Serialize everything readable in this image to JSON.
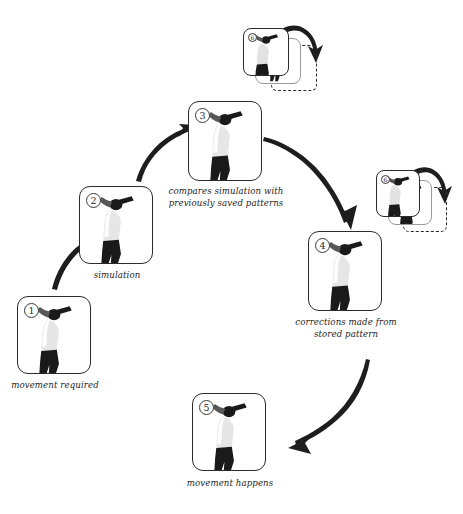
{
  "diagram": {
    "style": "hand-drawn flow diagram, black ink on white",
    "background_color": "#ffffff",
    "ink_color": "#1d1d1d"
  },
  "steps": [
    {
      "id": "step-1",
      "badge": "1",
      "caption": "movement required",
      "figure": "golfer-silhouette"
    },
    {
      "id": "step-2",
      "badge": "2",
      "caption": "simulation",
      "figure": "golfer-silhouette"
    },
    {
      "id": "step-3",
      "badge": "3",
      "caption": "compares simulation with\npreviously saved patterns",
      "figure": "golfer-silhouette"
    },
    {
      "id": "step-4",
      "badge": "4",
      "caption": "corrections made from\nstored pattern",
      "figure": "golfer-silhouette"
    },
    {
      "id": "step-5",
      "badge": "5",
      "caption": "movement happens",
      "figure": "golfer-silhouette"
    }
  ],
  "memory_stacks": [
    {
      "id": "memory-stack-top",
      "badge": "6",
      "caption": ""
    },
    {
      "id": "memory-stack-right",
      "badge": "6",
      "caption": ""
    }
  ],
  "arrows": [
    {
      "id": "arrow-1-to-2",
      "from": "step-1",
      "to": "step-2",
      "shape": "curve-up-right"
    },
    {
      "id": "arrow-2-to-3",
      "from": "step-2",
      "to": "step-3",
      "shape": "curve-up-right"
    },
    {
      "id": "arrow-3-to-4",
      "from": "step-3",
      "to": "step-4",
      "shape": "long-curve-down-right"
    },
    {
      "id": "arrow-4-to-5",
      "from": "step-4",
      "to": "step-5",
      "shape": "long-curve-down-left"
    },
    {
      "id": "arrow-store-top",
      "from": "memory-stack-top",
      "to": "memory-slot-top",
      "shape": "hook-over-right"
    },
    {
      "id": "arrow-store-right",
      "from": "memory-stack-right",
      "to": "memory-slot-right",
      "shape": "hook-over-right"
    }
  ]
}
